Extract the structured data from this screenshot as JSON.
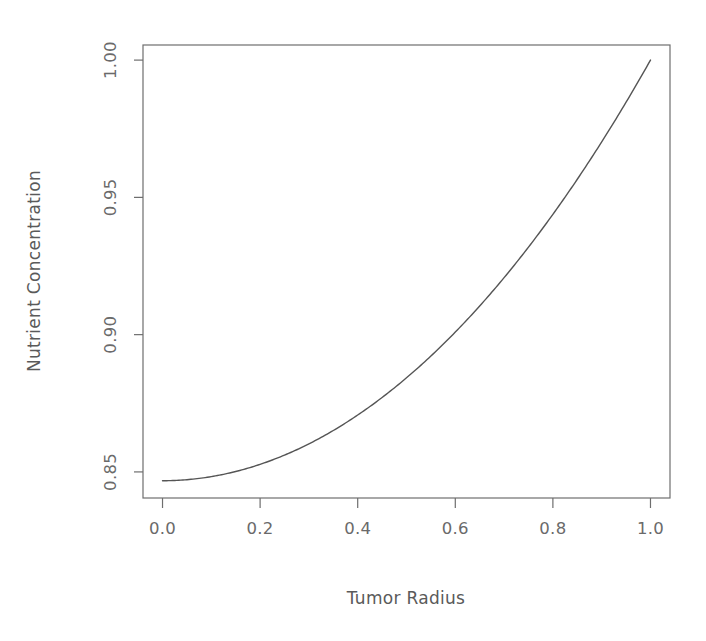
{
  "chart_data": {
    "type": "line",
    "title": "",
    "subtitle": "",
    "xlabel": "Tumor Radius",
    "ylabel": "Nutrient Concentration",
    "xlim": [
      -0.04,
      1.04
    ],
    "ylim": [
      0.8405,
      1.0055
    ],
    "xticks": [
      0.0,
      0.2,
      0.4,
      0.6,
      0.8,
      1.0
    ],
    "xtick_labels": [
      "0.0",
      "0.2",
      "0.4",
      "0.6",
      "0.8",
      "1.0"
    ],
    "yticks": [
      0.85,
      0.9,
      0.95,
      1.0
    ],
    "ytick_labels": [
      "0.85",
      "0.90",
      "0.95",
      "1.00"
    ],
    "grid": false,
    "legend": null,
    "box": true,
    "line_color": "#555555",
    "line_width": 1.4,
    "series": [
      {
        "name": "Nutrient Concentration",
        "x": [
          0.0,
          0.05,
          0.1,
          0.15,
          0.2,
          0.25,
          0.3,
          0.35,
          0.4,
          0.45,
          0.5,
          0.55,
          0.6,
          0.65,
          0.7,
          0.75,
          0.8,
          0.85,
          0.9,
          0.95,
          1.0
        ],
        "values": [
          0.8468,
          0.847,
          0.8474,
          0.8482,
          0.8493,
          0.8506,
          0.8523,
          0.8543,
          0.8566,
          0.8592,
          0.8622,
          0.8655,
          0.8692,
          0.8732,
          0.8776,
          0.8824,
          0.8876,
          0.8932,
          0.8993,
          0.9058,
          1.0
        ]
      }
    ],
    "annotations": []
  },
  "axes": {
    "x_title": "Tumor Radius",
    "y_title": "Nutrient Concentration",
    "x_tick_0": "0.0",
    "x_tick_1": "0.2",
    "x_tick_2": "0.4",
    "x_tick_3": "0.6",
    "x_tick_4": "0.8",
    "x_tick_5": "1.0",
    "y_tick_0": "0.85",
    "y_tick_1": "0.90",
    "y_tick_2": "0.95",
    "y_tick_3": "1.00"
  },
  "colors": {
    "background": "#ffffff",
    "axis": "#6e6e6e",
    "text": "#5a5a5a",
    "line": "#555555"
  }
}
